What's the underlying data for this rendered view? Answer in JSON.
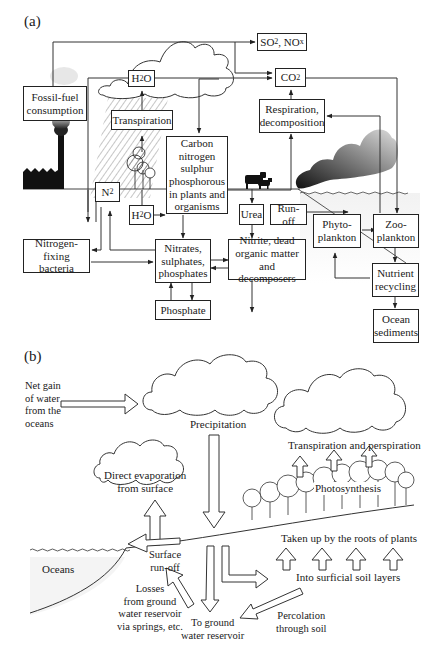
{
  "panels": {
    "a": {
      "label": "(a)",
      "boxes": {
        "fossil_fuel": "Fossil-fuel consumption",
        "h2o_top": "H2O",
        "so2_nox": "SO2, NOx",
        "co2": "CO2",
        "transpiration": "Transpiration",
        "respiration": "Respiration, decomposition",
        "cnsp": "Carbon nitrogen sulphur phosphorous in plants and organisms",
        "n2": "N2",
        "h2o_low": "H2O",
        "urea": "Urea",
        "runoff": "Run-off",
        "phytoplankton": "Phyto-plankton",
        "zooplankton": "Zoo-plankton",
        "nitrogen_fixing": "Nitrogen-fixing bacteria",
        "nitrates": "Nitrates, sulphates, phosphates",
        "nitrite": "Nitrite, dead organic matter and decomposers",
        "nutrient_recycling": "Nutrient recycling",
        "phosphate": "Phosphate",
        "ocean_sediments": "Ocean sediments"
      }
    },
    "b": {
      "label": "(b)",
      "labels": {
        "net_gain": [
          "Net gain",
          "of water",
          "from the",
          "oceans"
        ],
        "precipitation": "Precipitation",
        "direct_evaporation": [
          "Direct evaporation",
          "from surface"
        ],
        "transpiration_perspiration": "Transpiration and perspiration",
        "photosynthesis": "Photosynthesis",
        "taken_up": "Taken up by the roots of plants",
        "surface_runoff": [
          "Surface",
          "run-off"
        ],
        "oceans": "Oceans",
        "surficial": "Into surficial soil layers",
        "losses": [
          "Losses",
          "from ground",
          "water reservoir",
          "via springs, etc."
        ],
        "to_ground": [
          "To ground",
          "water reservoir"
        ],
        "percolation": [
          "Percolation",
          "through soil"
        ]
      }
    }
  }
}
